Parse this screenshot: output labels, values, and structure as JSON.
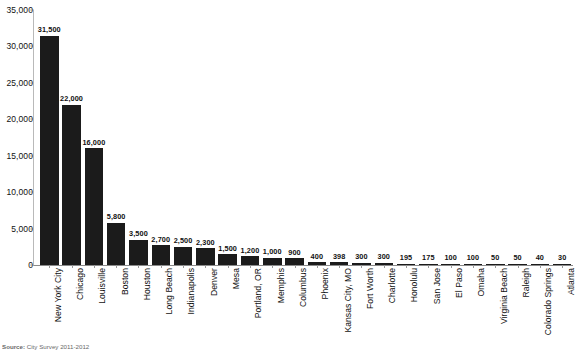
{
  "chart_data": {
    "type": "bar",
    "title": "",
    "xlabel": "",
    "ylabel": "",
    "ylim": [
      0,
      35000
    ],
    "grid": false,
    "legend": "none",
    "y_ticks": [
      "0",
      "5,000",
      "10,000",
      "15,000",
      "20,000",
      "25,000",
      "30,000",
      "35,000"
    ],
    "y_tick_values": [
      0,
      5000,
      10000,
      15000,
      20000,
      25000,
      30000,
      35000
    ],
    "bar_color": "#1b1b1b",
    "categories": [
      "New York City",
      "Chicago",
      "Louisville",
      "Boston",
      "Houston",
      "Long Beach",
      "Indianapolis",
      "Denver",
      "Mesa",
      "Portland, OR",
      "Memphis",
      "Columbus",
      "Phoenix",
      "Kansas City, MO",
      "Fort Worth",
      "Charlotte",
      "Honolulu",
      "San Jose",
      "El Paso",
      "Omaha",
      "Virginia Beach",
      "Raleigh",
      "Colorado Springs",
      "Atlanta"
    ],
    "values": [
      31500,
      22000,
      16000,
      5800,
      3500,
      2700,
      2500,
      2300,
      1500,
      1200,
      1000,
      900,
      400,
      398,
      300,
      300,
      195,
      175,
      100,
      100,
      50,
      50,
      40,
      30
    ],
    "data_labels": [
      "31,500",
      "22,000",
      "16,000",
      "5,800",
      "3,500",
      "2,700",
      "2,500",
      "2,300",
      "1,500",
      "1,200",
      "1,000",
      "900",
      "400",
      "398",
      "300",
      "300",
      "195",
      "175",
      "100",
      "100",
      "50",
      "50",
      "40",
      "30"
    ]
  },
  "footer": {
    "source_prefix": "Source:",
    "source_text": "City Survey 2011-2012"
  }
}
